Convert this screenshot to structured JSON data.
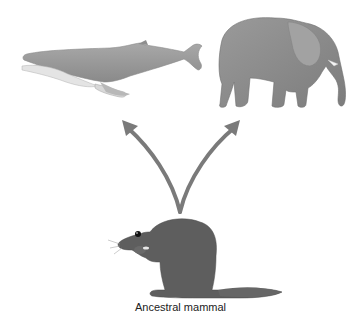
{
  "diagram": {
    "caption": "Ancestral mammal",
    "nodes": [
      {
        "id": "whale",
        "label": "Whale",
        "icon": "whale-icon"
      },
      {
        "id": "elephant",
        "label": "Elephant",
        "icon": "elephant-icon"
      },
      {
        "id": "ancestor",
        "label": "Ancestral mammal",
        "icon": "rodent-icon"
      }
    ],
    "edges": [
      {
        "from": "ancestor",
        "to": "whale"
      },
      {
        "from": "ancestor",
        "to": "elephant"
      }
    ],
    "colors": {
      "arrow": "#7a7a7a",
      "whale_body": "#9a9a9a",
      "whale_belly": "#dcdcdc",
      "elephant": "#8c8c8c",
      "rodent": "#5e5e5e"
    }
  }
}
